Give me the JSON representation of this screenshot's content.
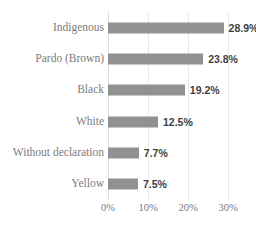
{
  "chart_data": {
    "type": "bar",
    "orientation": "horizontal",
    "title": "",
    "subtitle": "",
    "xlabel": "",
    "ylabel": "",
    "categories": [
      "Indigenous",
      "Pardo (Brown)",
      "Black",
      "White",
      "Without declaration",
      "Yellow"
    ],
    "values": [
      28.9,
      23.8,
      19.2,
      12.5,
      7.7,
      7.5
    ],
    "value_labels": [
      "28.9%",
      "23.8%",
      "19.2%",
      "12.5%",
      "7.7%",
      "7.5%"
    ],
    "xlim": [
      0,
      32
    ],
    "xticks": [
      0,
      10,
      20,
      30
    ],
    "xtick_labels": [
      "0%",
      "10%",
      "20%",
      "30%"
    ],
    "grid": true,
    "grid_axis": "x",
    "legend": false,
    "legend_position": "none",
    "bar_color": "#919191",
    "gridline_color": "#e9e9e9",
    "category_label_color": "#7c7c7c",
    "value_label_color": "#3f3f3f",
    "background_color": "#ffffff"
  }
}
